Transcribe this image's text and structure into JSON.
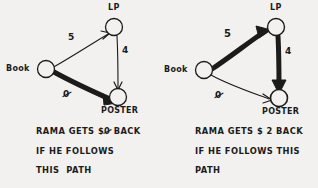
{
  "diagram": {
    "title_semantic": "two-hand-drawn-graph-diagrams-comparing-paths",
    "ink_color": "#1b1b1b",
    "paper_color": "#f2f1ef"
  },
  "panels": [
    {
      "id": "left",
      "nodes": [
        {
          "id": "book",
          "label": "Book"
        },
        {
          "id": "lp",
          "label": "LP"
        },
        {
          "id": "poster",
          "label": "POSTER"
        }
      ],
      "edges": [
        {
          "id": "book-lp",
          "from": "Book",
          "to": "LP",
          "weight": "5",
          "emphasis": "thin"
        },
        {
          "id": "lp-poster",
          "from": "LP",
          "to": "POSTER",
          "weight": "4",
          "emphasis": "thin"
        },
        {
          "id": "book-poster",
          "from": "Book",
          "to": "POSTER",
          "weight": "0",
          "weight_style": "slashed-zero",
          "emphasis": "bold"
        }
      ],
      "caption_lines": [
        "RAMA GETS $0 BACK",
        "IF HE FOLLOWS",
        "THIS  PATH"
      ],
      "caption_amount": "0",
      "caption_amount_style": "slashed-zero",
      "caption_prefix": "RAMA GETS $",
      "caption_suffix": " BACK"
    },
    {
      "id": "right",
      "nodes": [
        {
          "id": "book",
          "label": "Book"
        },
        {
          "id": "lp",
          "label": "LP"
        },
        {
          "id": "poster",
          "label": "POSTER"
        }
      ],
      "edges": [
        {
          "id": "book-lp",
          "from": "Book",
          "to": "LP",
          "weight": "5",
          "emphasis": "bold"
        },
        {
          "id": "lp-poster",
          "from": "LP",
          "to": "POSTER",
          "weight": "4",
          "emphasis": "bold"
        },
        {
          "id": "book-poster",
          "from": "Book",
          "to": "POSTER",
          "weight": "0",
          "weight_style": "slashed-zero",
          "emphasis": "thin"
        }
      ],
      "caption_lines": [
        "RAMA GETS $ 2 BACK",
        "IF HE FOLLOWS THIS",
        "PATH"
      ],
      "caption_amount": "2",
      "caption_prefix": "RAMA GETS $ ",
      "caption_suffix": " BACK"
    }
  ]
}
